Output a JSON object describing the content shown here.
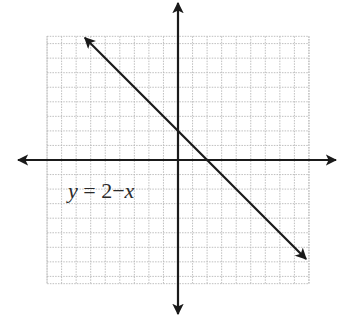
{
  "chart_data": {
    "type": "line",
    "title": "",
    "xlabel": "",
    "ylabel": "",
    "xlim": [
      -9,
      9
    ],
    "ylim": [
      -8.5,
      8.5
    ],
    "grid": true,
    "grid_step": 1,
    "axes_arrows": true,
    "series": [
      {
        "name": "y = 2 - x",
        "equation": "y = 2 - x",
        "slope": -1,
        "intercept": 2,
        "x": [
          -6.4,
          8.8
        ],
        "y": [
          8.4,
          -6.8
        ],
        "arrows_both_ends": true
      }
    ],
    "annotations": [
      {
        "text": "y = 2−x",
        "x": -7.5,
        "y": -2.6
      }
    ]
  },
  "labels": {
    "equation_var_y": "y",
    "equation_rest": " = 2−",
    "equation_var_x": "x"
  },
  "colors": {
    "axis": "#1a1a1a",
    "line": "#1a1a1a",
    "grid": "#b8b8b8",
    "background": "#ffffff"
  }
}
